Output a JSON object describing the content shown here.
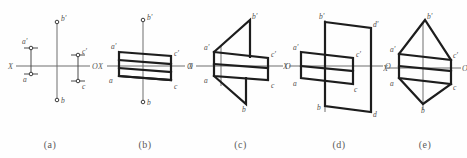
{
  "figure": {
    "title": "",
    "background_color": "#fefefe",
    "line_color": "#1d1d1d",
    "axis_color": "#6f6f6f",
    "label_color": "#4e4e4e",
    "width": 467,
    "height": 158
  },
  "panels": [
    {
      "id": "a",
      "caption": "(a)",
      "description": "point-projections-only",
      "axis": {
        "x_label": "X",
        "o_label": "O"
      },
      "vertex_labels": [
        "b'",
        "a'",
        "a",
        "c'",
        "c",
        "b"
      ],
      "points": [
        {
          "label": "b'",
          "x": 57,
          "y": 22
        },
        {
          "label": "a'",
          "x": 31,
          "y": 48
        },
        {
          "label": "a",
          "x": 31,
          "y": 74
        },
        {
          "label": "c'",
          "x": 78,
          "y": 55
        },
        {
          "label": "c",
          "x": 78,
          "y": 81
        },
        {
          "label": "b",
          "x": 57,
          "y": 100
        }
      ]
    },
    {
      "id": "b",
      "caption": "(b)",
      "description": "parallelogram-projections",
      "axis": {
        "x_label": "X",
        "o_label": "O"
      },
      "vertex_labels": [
        "b'",
        "a'",
        "a",
        "c'",
        "c",
        "b"
      ]
    },
    {
      "id": "c",
      "caption": "(c)",
      "description": "parallelogram-with-triangles",
      "axis": {
        "x_label": "X",
        "o_label": "O"
      },
      "vertex_labels": [
        "b'",
        "a'",
        "a",
        "c'",
        "c",
        "b"
      ]
    },
    {
      "id": "d",
      "caption": "(d)",
      "description": "two-offset-parallelograms",
      "axis": {
        "x_label": "X",
        "o_label": "O"
      },
      "vertex_labels": [
        "b'",
        "d'",
        "a'",
        "c'",
        "a",
        "c",
        "b",
        "d"
      ]
    },
    {
      "id": "e",
      "caption": "(e)",
      "description": "hexagonal-solid-projection",
      "axis": {
        "x_label": "X",
        "o_label": "O"
      },
      "vertex_labels": [
        "b'",
        "a'",
        "c'",
        "a",
        "c",
        "b"
      ]
    }
  ]
}
